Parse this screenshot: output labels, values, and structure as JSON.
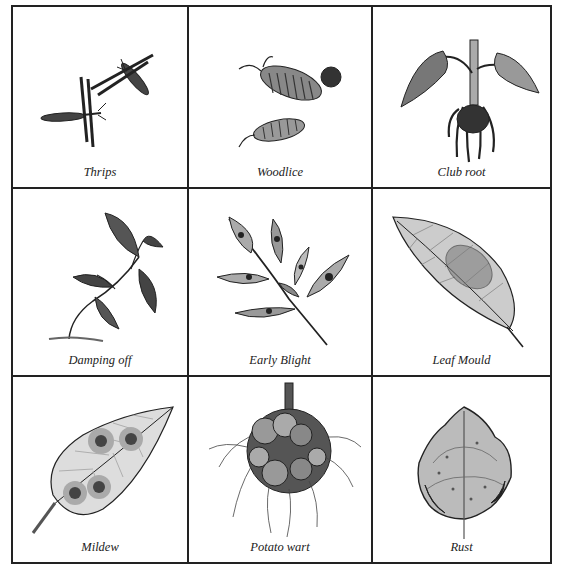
{
  "grid": {
    "cells": [
      {
        "label": "Thrips",
        "icon": "thrips-icon"
      },
      {
        "label": "Woodlice",
        "icon": "woodlice-icon"
      },
      {
        "label": "Club root",
        "icon": "club-root-icon"
      },
      {
        "label": "Damping off",
        "icon": "damping-off-icon"
      },
      {
        "label": "Early Blight",
        "icon": "early-blight-icon"
      },
      {
        "label": "Leaf Mould",
        "icon": "leaf-mould-icon"
      },
      {
        "label": "Mildew",
        "icon": "mildew-icon"
      },
      {
        "label": "Potato wart",
        "icon": "potato-wart-icon"
      },
      {
        "label": "Rust",
        "icon": "rust-icon"
      }
    ]
  }
}
